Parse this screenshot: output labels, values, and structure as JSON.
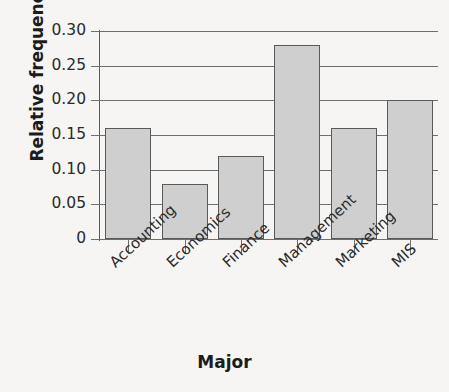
{
  "chart_data": {
    "type": "bar",
    "title": "",
    "xlabel": "Major",
    "ylabel": "Relative frequency",
    "categories": [
      "Accounting",
      "Economics",
      "Finance",
      "Management",
      "Marketing",
      "MIS"
    ],
    "values": [
      0.16,
      0.08,
      0.12,
      0.28,
      0.16,
      0.2
    ],
    "ylim": [
      0,
      0.3
    ],
    "ytick_labels": [
      "0.30",
      "0.25",
      "0.20",
      "0.15",
      "0.10",
      "0.05",
      "0"
    ],
    "ytick_values": [
      0.3,
      0.25,
      0.2,
      0.15,
      0.1,
      0.05,
      0
    ],
    "grid": true,
    "legend": false,
    "bar_fill_color": "#cfcfcf",
    "bar_edge_color": "#595959",
    "grid_color": "#6f6f6f",
    "background_color": "#f6f5f3",
    "text_color": "#1c1c1c"
  }
}
